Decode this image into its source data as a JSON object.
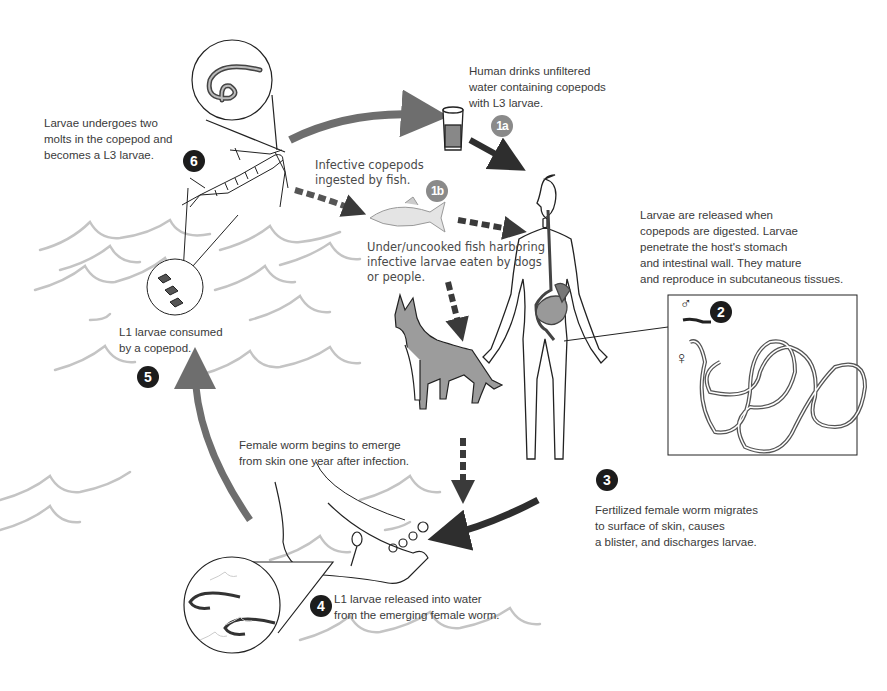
{
  "diagram": {
    "stages": [
      {
        "id": "1a",
        "badge": "1a",
        "text": "Human drinks unfiltered\nwater containing copepods\nwith L3 larvae."
      },
      {
        "id": "1b",
        "badge": "1b",
        "text": "Infective copepods\ningested by fish.",
        "text2": "Under/uncooked fish harboring\ninfective larvae eaten by dogs\nor people."
      },
      {
        "id": "2",
        "badge": "2",
        "text": "Larvae are released when\ncopepods are digested.  Larvae\npenetrate the host's stomach\nand intestinal wall.  They mature\nand reproduce in subcutaneous tissues."
      },
      {
        "id": "3",
        "badge": "3",
        "text": "Fertilized female worm migrates\nto surface of skin, causes\na blister, and discharges larvae."
      },
      {
        "id": "4",
        "badge": "4",
        "text": "L1 larvae released into water\nfrom the emerging female worm."
      },
      {
        "id": "5",
        "badge": "5",
        "text": "L1 larvae consumed\nby a copepod."
      },
      {
        "id": "6",
        "badge": "6",
        "text": "Larvae undergoes two\nmolts in the copepod and\nbecomes a L3 larvae."
      }
    ],
    "extra_labels": {
      "emerge": "Female worm begins to emerge\nfrom skin one year after infection."
    },
    "symbols": {
      "male": "♂",
      "female": "♀"
    },
    "colors": {
      "badge_dark": "#1c1c1c",
      "badge_grey": "#8a8a8a",
      "arrow_dark": "#2e2e2e",
      "arrow_grey": "#6e6e6e",
      "water": "#c4c4c4"
    }
  }
}
